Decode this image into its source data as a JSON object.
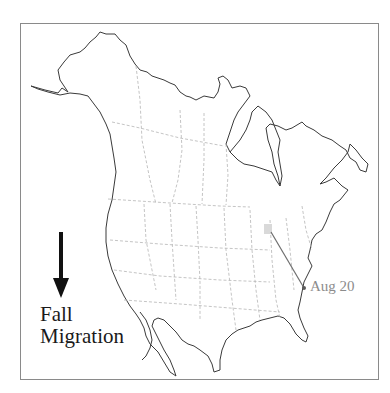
{
  "map": {
    "title_line1": "Fall",
    "title_line2": "Migration",
    "direction_icon": "arrow-down-icon",
    "region": "North America",
    "colors": {
      "coastline": "#3a3a3a",
      "borders": "#b5b5b5",
      "path": "#6e6e6e",
      "origin_highlight": "#d9d9d9",
      "label": "#8c8c8c",
      "frame": "#8a8a8a"
    },
    "migration_path": {
      "start": {
        "x": 271,
        "y": 232
      },
      "end": {
        "x": 304,
        "y": 288
      },
      "label": "Aug 20"
    }
  }
}
